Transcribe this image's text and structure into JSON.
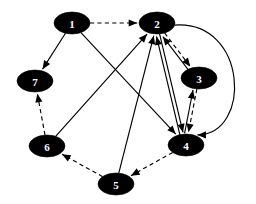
{
  "diagram": {
    "type": "directed-graph",
    "canvas": {
      "width": 256,
      "height": 204,
      "background": "#ffffff"
    },
    "node_style": {
      "shape": "ellipse",
      "rx": 18,
      "ry": 11,
      "fill": "#000000",
      "label_color": "#ffffff"
    },
    "edge_style": {
      "stroke": "#000000",
      "solid_label": "solid",
      "dashed_label": "dashed"
    },
    "nodes": [
      {
        "id": "1",
        "label": "1",
        "x": 72,
        "y": 23
      },
      {
        "id": "2",
        "label": "2",
        "x": 157,
        "y": 23
      },
      {
        "id": "3",
        "label": "3",
        "x": 199,
        "y": 78
      },
      {
        "id": "4",
        "label": "4",
        "x": 186,
        "y": 145
      },
      {
        "id": "5",
        "label": "5",
        "x": 116,
        "y": 184
      },
      {
        "id": "6",
        "label": "6",
        "x": 47,
        "y": 146
      },
      {
        "id": "7",
        "label": "7",
        "x": 35,
        "y": 81
      }
    ],
    "edges": [
      {
        "from": "1",
        "to": "2",
        "style": "dashed",
        "shape": "straight"
      },
      {
        "from": "1",
        "to": "7",
        "style": "solid",
        "shape": "straight"
      },
      {
        "from": "1",
        "to": "4",
        "style": "solid",
        "shape": "straight"
      },
      {
        "from": "2",
        "to": "3",
        "style": "dashed",
        "shape": "straight"
      },
      {
        "from": "2",
        "to": "4",
        "style": "solid",
        "shape": "straight"
      },
      {
        "from": "2",
        "to": "4",
        "style": "solid",
        "shape": "curved-right"
      },
      {
        "from": "3",
        "to": "2",
        "style": "solid",
        "shape": "straight"
      },
      {
        "from": "3",
        "to": "4",
        "style": "dashed",
        "shape": "straight"
      },
      {
        "from": "4",
        "to": "2",
        "style": "solid",
        "shape": "straight"
      },
      {
        "from": "4",
        "to": "3",
        "style": "solid",
        "shape": "straight"
      },
      {
        "from": "4",
        "to": "5",
        "style": "dashed",
        "shape": "straight"
      },
      {
        "from": "5",
        "to": "2",
        "style": "solid",
        "shape": "straight"
      },
      {
        "from": "5",
        "to": "6",
        "style": "dashed",
        "shape": "straight"
      },
      {
        "from": "6",
        "to": "2",
        "style": "solid",
        "shape": "straight"
      },
      {
        "from": "6",
        "to": "7",
        "style": "dashed",
        "shape": "straight"
      }
    ]
  }
}
